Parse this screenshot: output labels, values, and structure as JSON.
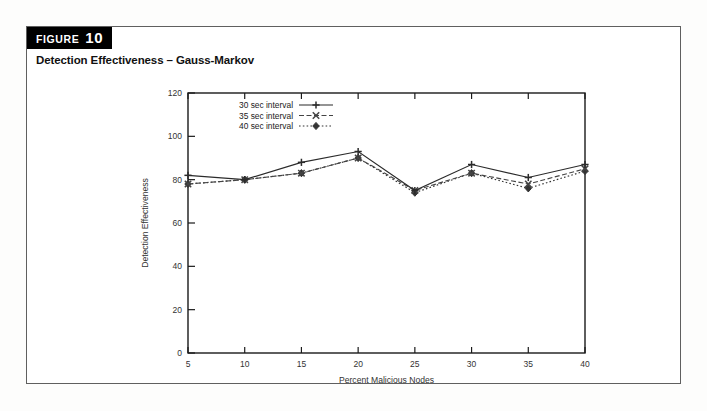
{
  "figure": {
    "tab_keyword": "FIGURE",
    "tab_number": "10",
    "caption": "Detection Effectiveness – Gauss-Markov"
  },
  "colors": {
    "frame": "#5f5f5f",
    "tab_bg": "#000000",
    "tab_fg": "#ffffff",
    "axis": "#1a1a1a",
    "series_1": "#2b2b2b",
    "series_2": "#444444",
    "series_3": "#333333"
  },
  "chart_data": {
    "type": "line",
    "title": "Detection Effectiveness – Gauss-Markov",
    "xlabel": "Percent Malicious Nodes",
    "ylabel": "Detection Effectiveness",
    "x": [
      5,
      10,
      15,
      20,
      25,
      30,
      35,
      40
    ],
    "xticklabels": [
      "5",
      "10",
      "15",
      "20",
      "25",
      "30",
      "35",
      "40"
    ],
    "yticklabels": [
      "0",
      "20",
      "40",
      "60",
      "80",
      "100",
      "120"
    ],
    "xlim": [
      5,
      40
    ],
    "ylim": [
      0,
      120
    ],
    "ytick_step": 20,
    "xtick_step": 5,
    "grid": false,
    "legend_position": "upper-left-inside",
    "series": [
      {
        "name": "30 sec interval",
        "marker": "plus",
        "linestyle": "solid",
        "values": [
          82,
          80,
          88,
          93,
          75,
          87,
          81,
          87
        ]
      },
      {
        "name": "35 sec interval",
        "marker": "cross",
        "linestyle": "dashed",
        "values": [
          78,
          80,
          83,
          90,
          75,
          83,
          78,
          85
        ]
      },
      {
        "name": "40 sec interval",
        "marker": "diamond",
        "linestyle": "dotted",
        "values": [
          78,
          80,
          83,
          90,
          74,
          83,
          76,
          84
        ]
      }
    ]
  }
}
